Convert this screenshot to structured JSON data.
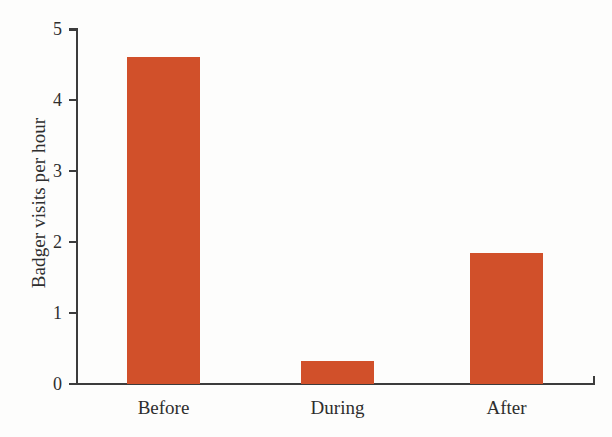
{
  "chart_data": {
    "type": "bar",
    "title": "",
    "subtitle": "",
    "xlabel": "",
    "ylabel": "Badger visits per hour",
    "categories": [
      "Before",
      "During",
      "After"
    ],
    "values": [
      4.6,
      0.32,
      1.85
    ],
    "series": [
      {
        "name": "Badger visits per hour",
        "values": [
          4.6,
          0.32,
          1.85
        ],
        "color": "#d1502a"
      }
    ],
    "ylim": [
      0,
      5
    ],
    "yticks": [
      0,
      1,
      2,
      3,
      4,
      5
    ],
    "ytick_labels": [
      "0",
      "1",
      "2",
      "3",
      "4",
      "5"
    ],
    "grid": false,
    "legend": false,
    "legend_position": "none",
    "bar_color": "#d1502a",
    "axis_color": "#3c3c3c",
    "background_color": "#fdfdfc",
    "text_color": "#2e2e2e"
  },
  "axis": {
    "y_label": "Badger visits per hour",
    "ticks": [
      {
        "label": "5",
        "value": 5
      },
      {
        "label": "4",
        "value": 4
      },
      {
        "label": "3",
        "value": 3
      },
      {
        "label": "2",
        "value": 2
      },
      {
        "label": "1",
        "value": 1
      },
      {
        "label": "0",
        "value": 0
      }
    ]
  },
  "bars": [
    {
      "label": "Before",
      "value": 4.6
    },
    {
      "label": "During",
      "value": 0.32
    },
    {
      "label": "After",
      "value": 1.85
    }
  ]
}
